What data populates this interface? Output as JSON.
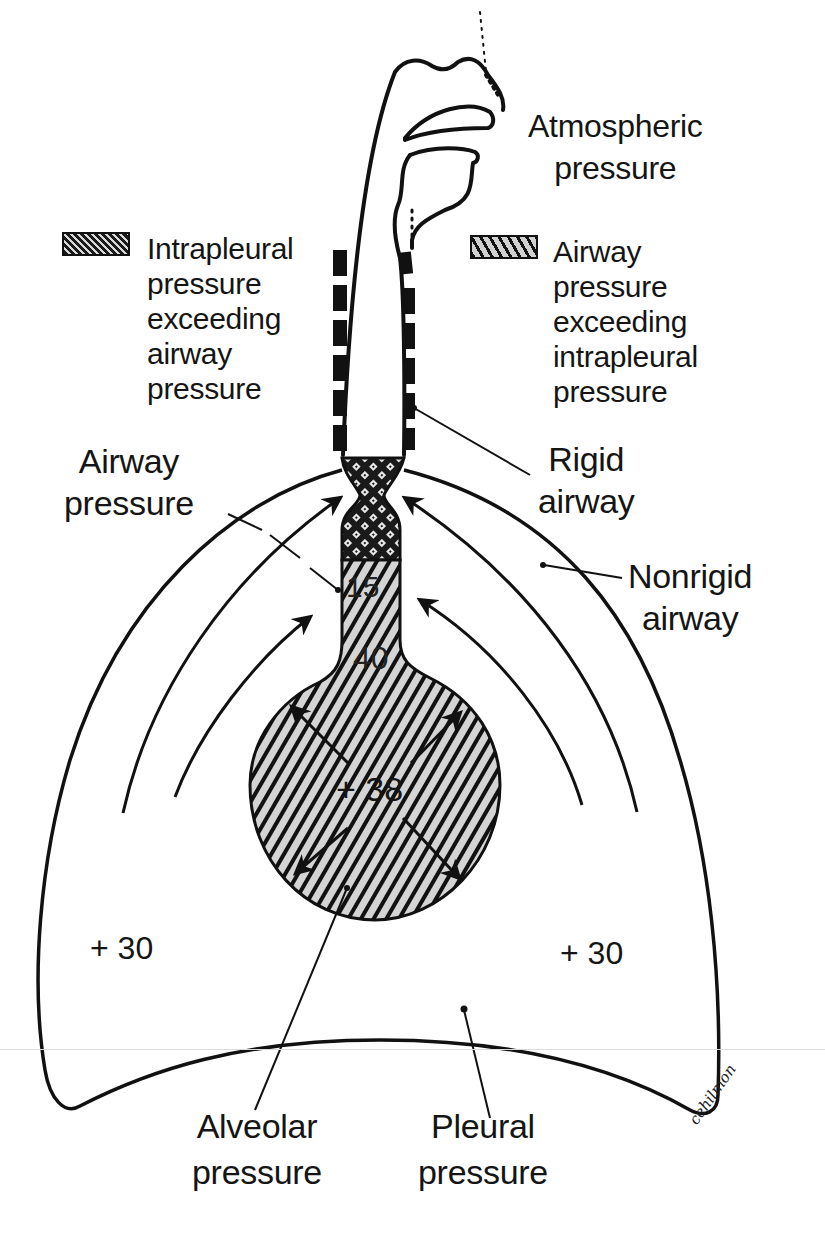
{
  "figure": {
    "labels": {
      "atmospheric": [
        "Atmospheric",
        "pressure"
      ],
      "legend_intrapleural": [
        "Intrapleural",
        "pressure",
        "exceeding",
        "airway",
        "pressure"
      ],
      "legend_airway": [
        "Airway",
        "pressure",
        "exceeding",
        "intrapleural",
        "pressure"
      ],
      "airway_pressure": [
        "Airway",
        "pressure"
      ],
      "rigid_airway": [
        "Rigid",
        "airway"
      ],
      "nonrigid_airway": [
        "Nonrigid",
        "airway"
      ],
      "alveolar_pressure": [
        "Alveolar",
        "pressure"
      ],
      "pleural_pressure": [
        "Pleural",
        "pressure"
      ]
    },
    "values": {
      "airway_upper": "15",
      "airway_lower": "40",
      "alveolar": "+ 38",
      "pleural_left": "+ 30",
      "pleural_right": "+ 30"
    },
    "legend": [
      {
        "pattern": "crosshatch-dark",
        "meaning": "Intrapleural pressure exceeding airway pressure"
      },
      {
        "pattern": "diagonal-hatch",
        "meaning": "Airway pressure exceeding intrapleural pressure"
      }
    ],
    "signature": "cehilmon",
    "colors": {
      "ink": "#111111",
      "background": "#ffffff",
      "hatch_fill": "#cfcfcf"
    }
  }
}
